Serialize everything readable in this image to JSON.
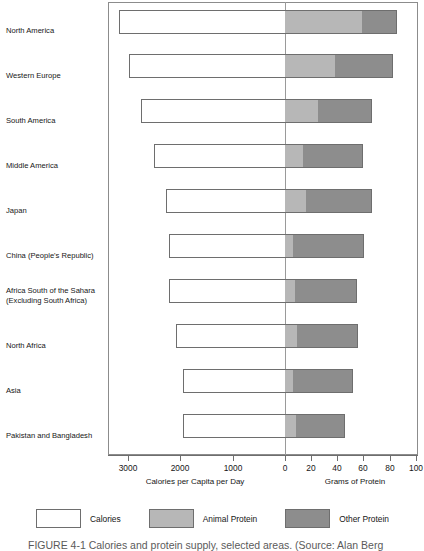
{
  "chart_data": {
    "type": "bar",
    "title": "",
    "subtitle": "",
    "orientation": "horizontal",
    "style": "bidirectional-stacked",
    "categories": [
      "North America",
      "Western Europe",
      "South America",
      "Middle America",
      "Japan",
      "China (People's Republic)",
      "Africa South of the Sahara (Excluding South Africa)",
      "North Africa",
      "Asia",
      "Pakistan and Bangladesh"
    ],
    "series": [
      {
        "name": "Calories",
        "axis": "left",
        "unit": "Calories per Capita per Day",
        "values": [
          3200,
          3140,
          2740,
          2520,
          2280,
          2220,
          2200,
          2080,
          1950,
          1950
        ]
      },
      {
        "name": "Animal Protein",
        "axis": "right",
        "unit": "Grams of Protein",
        "values": [
          60,
          39,
          26,
          14,
          16,
          6,
          8,
          9,
          6,
          8
        ]
      },
      {
        "name": "Other Protein",
        "axis": "right",
        "unit": "Grams of Protein",
        "values": [
          26,
          44,
          41,
          46,
          51,
          55,
          47,
          47,
          46,
          38
        ]
      }
    ],
    "total_protein": [
      86,
      83,
      67,
      60,
      67,
      61,
      55,
      56,
      52,
      46
    ],
    "left_axis": {
      "label": "Calories per Capita per Day",
      "ticks": [
        3000,
        2000,
        1000,
        0
      ],
      "range": [
        3400,
        0
      ],
      "direction": "right-to-left"
    },
    "right_axis": {
      "label": "Grams of Protein",
      "ticks": [
        0,
        20,
        40,
        60,
        80,
        100
      ],
      "range": [
        0,
        100
      ],
      "direction": "left-to-right"
    },
    "grid": false,
    "legend_position": "bottom",
    "legend": [
      {
        "label": "Calories",
        "color": "#ffffff"
      },
      {
        "label": "Animal Protein",
        "color": "#b7b7b7"
      },
      {
        "label": "Other Protein",
        "color": "#8d8d8d"
      }
    ],
    "zero_divider": true
  },
  "axes": {
    "left_title": "Calories per Capita per Day",
    "right_title": "Grams of Protein",
    "ticks": [
      {
        "label": "3000",
        "x": 128
      },
      {
        "label": "2000",
        "x": 180
      },
      {
        "label": "1000",
        "x": 233
      },
      {
        "label": "0",
        "x": 285
      },
      {
        "label": "20",
        "x": 311
      },
      {
        "label": "40",
        "x": 337
      },
      {
        "label": "60",
        "x": 363
      },
      {
        "label": "80",
        "x": 390
      },
      {
        "label": "100",
        "x": 416
      }
    ]
  },
  "bars": [
    {
      "label": "North America",
      "top": 10,
      "left": 119,
      "cal_w": 166,
      "animal_w": 78,
      "other_w": 34
    },
    {
      "label": "Western Europe",
      "top": 54,
      "left": 129,
      "cal_w": 156,
      "animal_w": 51,
      "other_w": 57
    },
    {
      "label": "South America",
      "top": 99,
      "left": 141,
      "cal_w": 144,
      "animal_w": 34,
      "other_w": 53
    },
    {
      "label": "Middle America",
      "top": 144,
      "left": 154,
      "cal_w": 131,
      "animal_w": 18,
      "other_w": 60
    },
    {
      "label": "Japan",
      "top": 189,
      "left": 166,
      "cal_w": 119,
      "animal_w": 21,
      "other_w": 66
    },
    {
      "label": "China (People's Republic)",
      "top": 234,
      "left": 169,
      "cal_w": 116,
      "animal_w": 8,
      "other_w": 71
    },
    {
      "label": "Africa South of the\nSahara (Excluding\nSouth Africa)",
      "top": 279,
      "left": 169,
      "cal_w": 116,
      "animal_w": 10,
      "other_w": 62
    },
    {
      "label": "North Africa",
      "top": 324,
      "left": 176,
      "cal_w": 109,
      "animal_w": 12,
      "other_w": 61
    },
    {
      "label": "Asia",
      "top": 369,
      "left": 183,
      "cal_w": 102,
      "animal_w": 8,
      "other_w": 60
    },
    {
      "label": "Pakistan and Bangladesh",
      "top": 414,
      "left": 183,
      "cal_w": 102,
      "animal_w": 11,
      "other_w": 49
    }
  ],
  "categories_display": [
    {
      "text": "North America",
      "top": 26
    },
    {
      "text": "Western Europe",
      "top": 71
    },
    {
      "text": "South America",
      "top": 116
    },
    {
      "text": "Middle America",
      "top": 161
    },
    {
      "text": "Japan",
      "top": 206
    },
    {
      "text": "China (People's Republic)",
      "top": 251
    },
    {
      "text": "Africa South of the Sahara (Excluding South Africa)",
      "top": 286
    },
    {
      "text": "North Africa",
      "top": 341
    },
    {
      "text": "Asia",
      "top": 386
    },
    {
      "text": "Pakistan and Bangladesh",
      "top": 431
    }
  ],
  "legend": {
    "items": [
      {
        "label": "Calories",
        "swatch": "calories-swatch"
      },
      {
        "label": "Animal Protein",
        "swatch": "animal-protein-swatch"
      },
      {
        "label": "Other Protein",
        "swatch": "other-protein-swatch"
      }
    ]
  },
  "caption": "FIGURE 4-1  Calories and protein supply, selected areas. (Source: Alan Berg"
}
